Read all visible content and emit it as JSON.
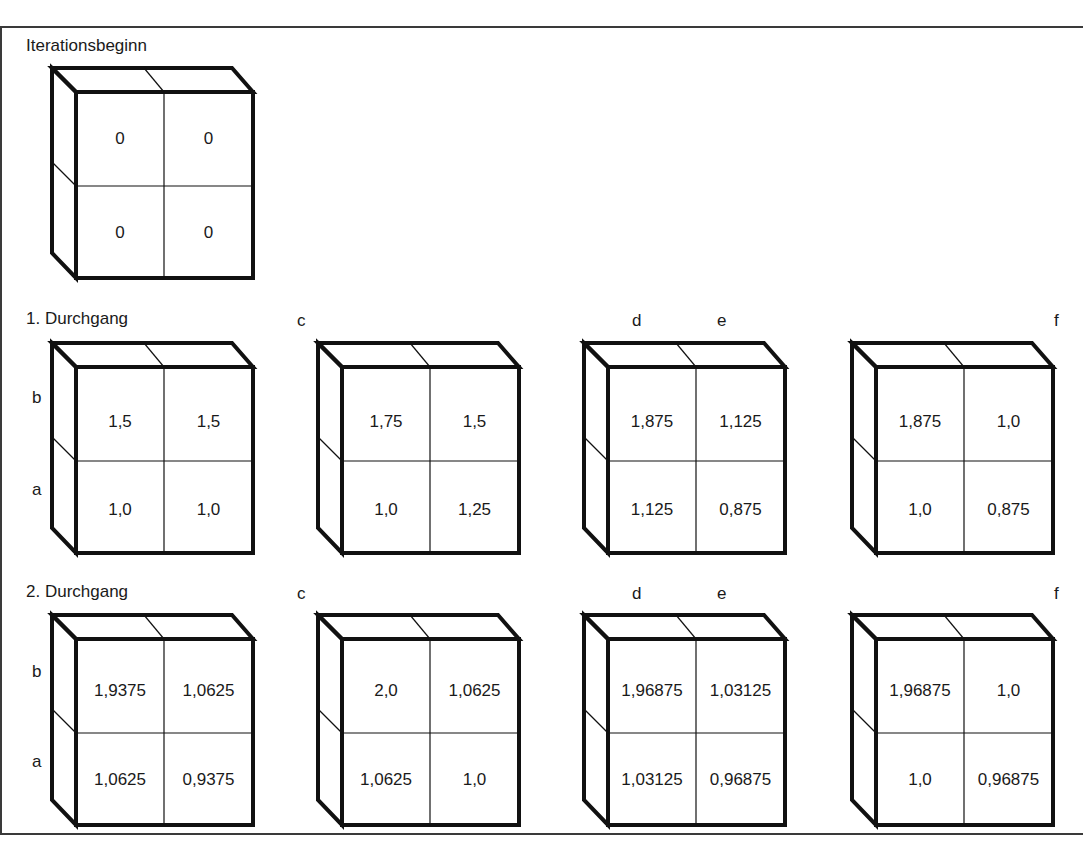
{
  "title": "Iterationsbeginn",
  "rows": [
    {
      "heading": "Iterationsbeginn",
      "cubes": [
        {
          "id": "start",
          "label": "",
          "cells": {
            "top_left": "0",
            "top_right": "0",
            "bottom_left": "0",
            "bottom_right": "0"
          }
        }
      ]
    },
    {
      "heading": "1. Durchgang",
      "side_labels": {
        "upper": "b",
        "lower": "a"
      },
      "cubes": [
        {
          "id": "p1-ab",
          "label": "",
          "cells": {
            "top_left": "1,5",
            "top_right": "1,5",
            "bottom_left": "1,0",
            "bottom_right": "1,0"
          }
        },
        {
          "id": "p1-c",
          "label": "c",
          "cells": {
            "top_left": "1,75",
            "top_right": "1,5",
            "bottom_left": "1,0",
            "bottom_right": "1,25"
          }
        },
        {
          "id": "p1-de",
          "label_left": "d",
          "label_right": "e",
          "cells": {
            "top_left": "1,875",
            "top_right": "1,125",
            "bottom_left": "1,125",
            "bottom_right": "0,875"
          }
        },
        {
          "id": "p1-f",
          "label": "f",
          "cells": {
            "top_left": "1,875",
            "top_right": "1,0",
            "bottom_left": "1,0",
            "bottom_right": "0,875"
          }
        }
      ]
    },
    {
      "heading": "2. Durchgang",
      "side_labels": {
        "upper": "b",
        "lower": "a"
      },
      "cubes": [
        {
          "id": "p2-ab",
          "label": "",
          "cells": {
            "top_left": "1,9375",
            "top_right": "1,0625",
            "bottom_left": "1,0625",
            "bottom_right": "0,9375"
          }
        },
        {
          "id": "p2-c",
          "label": "c",
          "cells": {
            "top_left": "2,0",
            "top_right": "1,0625",
            "bottom_left": "1,0625",
            "bottom_right": "1,0"
          }
        },
        {
          "id": "p2-de",
          "label_left": "d",
          "label_right": "e",
          "cells": {
            "top_left": "1,96875",
            "top_right": "1,03125",
            "bottom_left": "1,03125",
            "bottom_right": "0,96875"
          }
        },
        {
          "id": "p2-f",
          "label": "f",
          "cells": {
            "top_left": "1,96875",
            "top_right": "1,0",
            "bottom_left": "1,0",
            "bottom_right": "0,96875"
          }
        }
      ]
    }
  ]
}
